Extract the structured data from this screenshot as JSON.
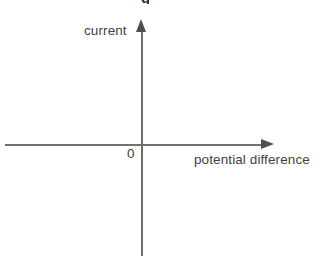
{
  "figure": {
    "background_color": "#ffffff",
    "line_color": "#4f4f4f",
    "text_color": "#3f3f3f",
    "width": 323,
    "height": 264,
    "cropped_heading_fragment": "g"
  },
  "chart_data": {
    "type": "line",
    "title": "",
    "subtitle": "",
    "xlabel": "potential difference",
    "ylabel": "current",
    "origin_label": "0",
    "series": [
      {
        "name": "",
        "x": [],
        "y": []
      }
    ],
    "x": [],
    "values": [],
    "categories": [],
    "xlim": [
      null,
      null
    ],
    "ylim": [
      null,
      null
    ],
    "xticks": [],
    "yticks": [],
    "xticklabels": [],
    "yticklabels": [],
    "grid": false,
    "legend": false,
    "legend_position": "none",
    "annotations": []
  },
  "axes": {
    "y": {
      "label": "current",
      "arrow": "arrow-up-icon",
      "direction": "up"
    },
    "x": {
      "label": "potential difference",
      "arrow": "arrow-right-icon",
      "direction": "right"
    },
    "origin": "0"
  }
}
